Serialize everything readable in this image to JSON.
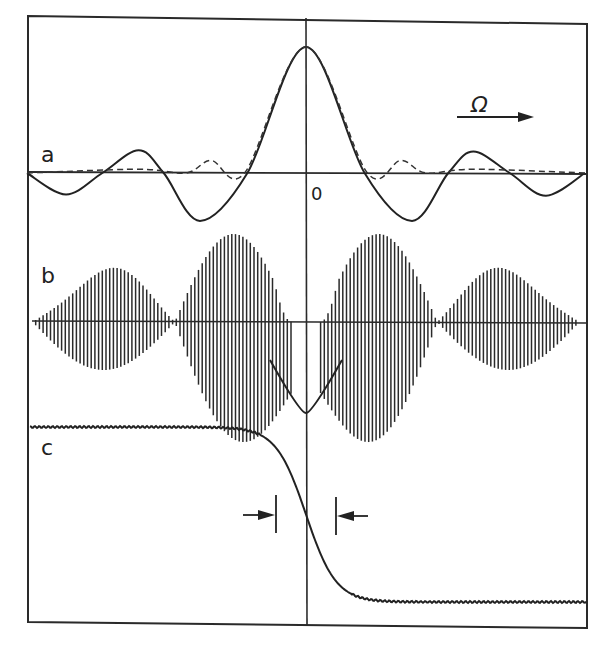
{
  "figure": {
    "panels": [
      "a",
      "b",
      "c"
    ],
    "axis_symbol": "Ω",
    "origin_label": "0",
    "ink_color": "#222222"
  },
  "chart_data": [
    {
      "panel": "a",
      "type": "line",
      "title": "",
      "xlabel": "Ω",
      "ylabel": "",
      "x_axis_direction": "increasing to the right (arrow)",
      "x_origin_label": "0",
      "grid": false,
      "legend": null,
      "series": [
        {
          "name": "solid",
          "style": "solid",
          "description": "symmetric oscillating spectrum, central peak at Ω=0, alternating sidelobes with deep negative lobes",
          "x_rel": [
            -1.0,
            -0.86,
            -0.73,
            -0.6,
            -0.51,
            -0.38,
            -0.21,
            0.0,
            0.21,
            0.38,
            0.51,
            0.6,
            0.73,
            0.86,
            1.0
          ],
          "y_rel": [
            0.0,
            -0.17,
            0.0,
            0.18,
            0.0,
            -0.38,
            0.0,
            1.0,
            0.0,
            -0.38,
            0.0,
            0.17,
            0.0,
            -0.18,
            0.0
          ]
        },
        {
          "name": "dashed",
          "style": "dashed",
          "description": "non-negative narrower central peak with small positive sidelobes",
          "x_rel": [
            -1.0,
            -0.6,
            -0.43,
            -0.34,
            -0.22,
            0.0,
            0.22,
            0.34,
            0.43,
            0.6,
            1.0
          ],
          "y_rel": [
            0.0,
            0.03,
            0.0,
            0.1,
            0.0,
            1.0,
            0.0,
            0.1,
            0.0,
            0.03,
            0.0
          ]
        }
      ]
    },
    {
      "panel": "b",
      "type": "line",
      "description": "rapidly oscillating signal under symmetric amplitude envelope; central gap with downward cusp at Ω=0",
      "envelope_lobes_x_rel": [
        -0.72,
        -0.25,
        0.25,
        0.72
      ],
      "envelope_lobe_peaks_rel": [
        0.45,
        1.0,
        1.0,
        0.45
      ],
      "center_cusp_y_rel": -1.0
    },
    {
      "panel": "c",
      "type": "line",
      "description": "smooth step from high plateau to low plateau centered at Ω=0, with small ripples on plateaus",
      "high_level_rel": 1.0,
      "low_level_rel": 0.0,
      "transition_center_x_rel": 0.0,
      "width_markers_x_rel": [
        -0.11,
        0.11
      ],
      "annotation": "arrows pointing inward marking transition width"
    }
  ]
}
